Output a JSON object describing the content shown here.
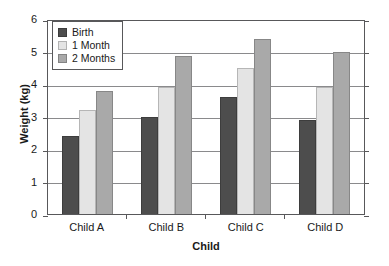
{
  "chart_data": {
    "type": "bar",
    "title": "",
    "xlabel": "Child",
    "ylabel": "Weight (kg)",
    "categories": [
      "Child A",
      "Child B",
      "Child C",
      "Child D"
    ],
    "series": [
      {
        "name": "Birth",
        "color": "#4d4d4d",
        "values": [
          2.4,
          3.0,
          3.6,
          2.9
        ]
      },
      {
        "name": "1 Month",
        "color": "#e4e4e4",
        "values": [
          3.2,
          3.9,
          4.5,
          3.9
        ]
      },
      {
        "name": "2 Months",
        "color": "#a9a9a9",
        "values": [
          3.8,
          4.85,
          5.4,
          5.0
        ]
      }
    ],
    "ylim": [
      0,
      6
    ],
    "yticks": [
      0,
      1,
      2,
      3,
      4,
      5,
      6
    ],
    "ytick_labels": [
      "0",
      "1",
      "2",
      "3",
      "4",
      "5",
      "6"
    ],
    "grid": true,
    "legend_position": "top-left"
  }
}
